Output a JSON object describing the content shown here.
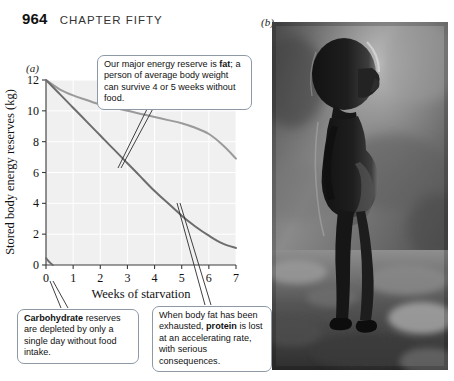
{
  "page": {
    "number": "964",
    "chapter_title": "CHAPTER FIFTY"
  },
  "panels": {
    "a_label": "(a)",
    "b_label": "(b)"
  },
  "callouts": {
    "fat": {
      "name": "callout-fat",
      "lines": [
        "Our major energy reserve is ",
        "fat",
        "; a person of average body weight can survive 4 or 5 weeks without food."
      ],
      "plain": "Our major energy reserve is fat; a person of average body weight can survive 4 or 5 weeks without food.",
      "bold_word": "fat"
    },
    "carbohydrate": {
      "name": "callout-carbohydrate",
      "plain": "Carbohydrate reserves are depleted by only a single day without food intake.",
      "bold_word": "Carbohydrate",
      "rest": " reserves are depleted by only a single day without food intake."
    },
    "protein": {
      "name": "callout-protein",
      "plain": "When body fat has been exhausted, protein is lost at an accelerating rate, with serious consequences.",
      "lead": "When body fat has been exhausted, ",
      "bold_word": "protein",
      "rest": " is lost at an accelerating rate, with serious consequences."
    }
  },
  "figure_b": {
    "description": "Black-and-white photograph of a severely malnourished child standing in profile with a distended abdomen",
    "alt_label": "(b)"
  },
  "chart_data": {
    "type": "line",
    "title": "",
    "xlabel": "Weeks of starvation",
    "ylabel": "Stored body energy reserves (kg)",
    "xlim": [
      0,
      7
    ],
    "ylim": [
      0,
      12
    ],
    "xticks": [
      "0",
      "1",
      "2",
      "3",
      "4",
      "5",
      "6",
      "7"
    ],
    "yticks": [
      "0",
      "2",
      "4",
      "6",
      "8",
      "10",
      "12"
    ],
    "grid": true,
    "legend": "none",
    "plot_bg": "#f0f0f0",
    "gridline_color": "#ffffff",
    "series": [
      {
        "name": "Fat",
        "color": "#9a9a9a",
        "x": [
          0,
          0.5,
          1,
          1.5,
          2,
          2.5,
          3,
          3.5,
          4,
          4.5,
          5,
          5.5,
          6,
          6.5,
          7
        ],
        "values": [
          12.0,
          11.4,
          11.0,
          10.7,
          10.4,
          10.2,
          10.0,
          9.8,
          9.6,
          9.4,
          9.2,
          8.9,
          8.5,
          7.8,
          6.9
        ]
      },
      {
        "name": "Protein",
        "color": "#6d6d6d",
        "x": [
          0,
          0.5,
          1,
          1.5,
          2,
          2.5,
          3,
          3.5,
          4,
          4.5,
          5,
          5.5,
          6,
          6.5,
          7
        ],
        "values": [
          12.0,
          11.1,
          10.2,
          9.3,
          8.4,
          7.5,
          6.6,
          5.7,
          4.8,
          4.0,
          3.2,
          2.5,
          1.9,
          1.4,
          1.1
        ]
      },
      {
        "name": "Carbohydrate",
        "color": "#6d6d6d",
        "x": [
          0,
          0.12,
          0.25
        ],
        "values": [
          0.45,
          0.2,
          0.0
        ]
      }
    ]
  }
}
